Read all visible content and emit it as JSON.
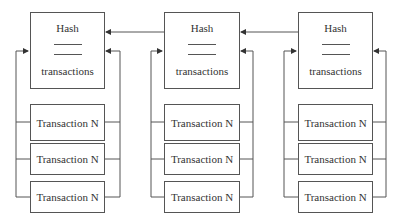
{
  "diagram": {
    "type": "blockchain-structure",
    "blocks": [
      {
        "header": {
          "hash_label": "Hash",
          "transactions_label": "transactions"
        },
        "transactions": [
          "Transaction N",
          "Transaction N",
          "Transaction N"
        ]
      },
      {
        "header": {
          "hash_label": "Hash",
          "transactions_label": "transactions"
        },
        "transactions": [
          "Transaction N",
          "Transaction N",
          "Transaction N"
        ]
      },
      {
        "header": {
          "hash_label": "Hash",
          "transactions_label": "transactions"
        },
        "transactions": [
          "Transaction N",
          "Transaction N",
          "Transaction N"
        ]
      }
    ],
    "links": [
      {
        "from": "block-2",
        "to": "block-1",
        "meaning": "hash pointer"
      },
      {
        "from": "block-3",
        "to": "block-2",
        "meaning": "hash pointer"
      }
    ],
    "colors": {
      "stroke": "#555555",
      "text": "#333333",
      "background": "#ffffff"
    }
  }
}
